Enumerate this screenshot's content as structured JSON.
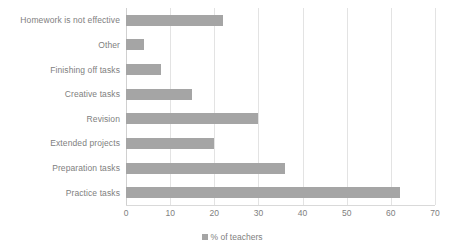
{
  "chart_data": {
    "type": "bar",
    "orientation": "horizontal",
    "title": "",
    "xlabel": "",
    "ylabel": "",
    "xlim": [
      0,
      70
    ],
    "xticks": [
      0,
      10,
      20,
      30,
      40,
      50,
      60,
      70
    ],
    "grid": true,
    "legend_position": "bottom",
    "categories": [
      "Homework is not effective",
      "Other",
      "Finishing off tasks",
      "Creative tasks",
      "Revision",
      "Extended projects",
      "Preparation tasks",
      "Practice tasks"
    ],
    "series": [
      {
        "name": "% of teachers",
        "color": "#a5a5a5",
        "values": [
          22,
          4,
          8,
          15,
          30,
          20,
          36,
          62
        ]
      }
    ]
  },
  "legend": {
    "marker_name": "legend-swatch",
    "label": "% of teachers"
  },
  "colors": {
    "bar": "#a5a5a5",
    "gridline": "#e3e3e3",
    "text": "#808080",
    "background": "#ffffff"
  }
}
